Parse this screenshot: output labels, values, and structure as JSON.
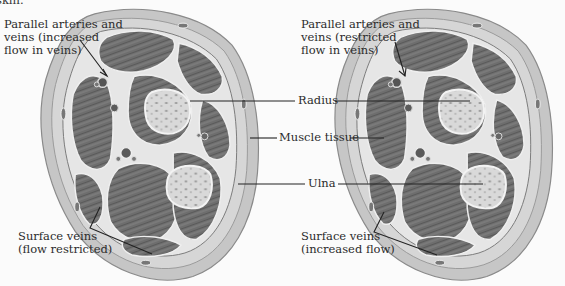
{
  "figure": {
    "top_fragment": "skin.",
    "left_panel": {
      "labels": {
        "parallel_vessels": [
          "Parallel arteries and",
          "veins (increased",
          "flow in veins)"
        ],
        "surface_veins": [
          "Surface veins",
          "(flow restricted)"
        ]
      }
    },
    "right_panel": {
      "labels": {
        "parallel_vessels": [
          "Parallel arteries and",
          "veins (restricted",
          "flow in veins)"
        ],
        "surface_veins": [
          "Surface veins",
          "(increased flow)"
        ]
      }
    },
    "shared_labels": {
      "radius": "Radius",
      "muscle_tissue": "Muscle tissue",
      "ulna": "Ulna"
    },
    "colors": {
      "background": "#fbfbfb",
      "skin_layer": "#c9c9c9",
      "muscle": "#6f6f6f",
      "fascia": "#e4e4e4",
      "bone": "#d8d8d8",
      "leader_line": "#222222"
    }
  }
}
